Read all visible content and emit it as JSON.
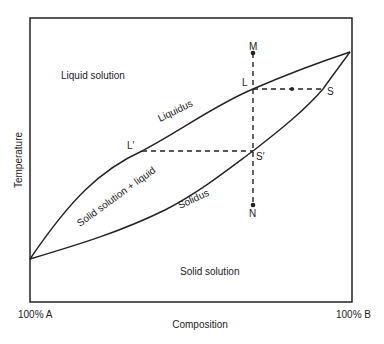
{
  "diagram": {
    "type": "binary-isomorphous-phase-diagram",
    "colors": {
      "line": "#222222",
      "text": "#222222",
      "background": "#ffffff"
    },
    "axes": {
      "x_label": "Composition",
      "y_label": "Temperature",
      "x_left_label": "100% A",
      "x_right_label": "100% B"
    },
    "regions": {
      "liquid": "Liquid solution",
      "two_phase": "Solid solution + liquid",
      "solid": "Solid solution"
    },
    "curves": {
      "liquidus": "Liquidus",
      "solidus": "Solidus"
    },
    "points": {
      "M": "M",
      "L": "L",
      "S": "S",
      "L_prime": "L′",
      "S_prime": "S′",
      "N": "N"
    }
  }
}
